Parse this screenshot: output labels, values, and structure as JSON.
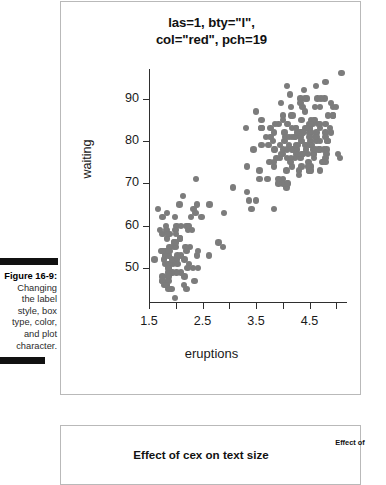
{
  "caption": {
    "figure_label": "Figure 16-9:",
    "text": "Changing the label style, box type, color, and plot character.",
    "lines": [
      "Figure 16-9:",
      "Changing",
      "the label",
      "style, box",
      "type, color,",
      "and plot",
      "character."
    ]
  },
  "main_figure": {
    "title_line1": "las=1, bty=\"l\",",
    "title_line2": "col=\"red\", pch=19"
  },
  "next_figure": {
    "title": "Effect of cex on text size",
    "side_title": "Effect of"
  },
  "colors": {
    "point_gray": "#7c7c7c",
    "axis": "#2f2f2f",
    "panel_border": "#b9b9b9",
    "rule_black": "#111111",
    "text": "#1a1a1a"
  },
  "chart_data": {
    "type": "scatter",
    "title": "las=1, bty=\"l\", col=\"red\", pch=19",
    "xlabel": "eruptions",
    "ylabel": "waiting",
    "xlim": [
      1.5,
      5.2
    ],
    "ylim": [
      42,
      97
    ],
    "grid": false,
    "legend": null,
    "point_color": "#7c7c7c",
    "point_symbol": "filled-circle",
    "x_ticks": [
      1.5,
      2.0,
      2.5,
      3.0,
      3.5,
      4.0,
      4.5,
      5.0
    ],
    "x_tick_labels": [
      "1.5",
      "",
      "2.5",
      "",
      "3.5",
      "",
      "4.5",
      ""
    ],
    "y_ticks": [
      50,
      60,
      70,
      80,
      90
    ],
    "y_tick_labels": [
      "50",
      "60",
      "70",
      "80",
      "90"
    ],
    "series": [
      {
        "name": "faithful",
        "x": [
          3.6,
          1.8,
          3.333,
          2.283,
          4.533,
          2.883,
          4.7,
          3.6,
          1.95,
          4.35,
          1.833,
          3.917,
          4.2,
          1.75,
          4.7,
          2.167,
          1.75,
          4.8,
          1.6,
          4.25,
          1.8,
          1.75,
          3.45,
          3.067,
          4.533,
          3.6,
          1.967,
          4.083,
          3.85,
          4.433,
          4.3,
          4.467,
          3.367,
          4.033,
          3.833,
          2.017,
          1.867,
          4.833,
          1.833,
          4.783,
          4.35,
          1.883,
          4.567,
          1.75,
          4.533,
          3.317,
          3.833,
          2.1,
          4.633,
          2.0,
          4.8,
          4.716,
          1.833,
          4.833,
          1.733,
          4.883,
          3.717,
          1.667,
          4.567,
          4.317,
          2.233,
          4.5,
          1.75,
          4.8,
          1.817,
          4.4,
          4.167,
          4.7,
          2.067,
          4.7,
          4.033,
          1.967,
          4.5,
          4.0,
          1.983,
          5.067,
          2.017,
          4.567,
          3.883,
          3.6,
          4.133,
          4.333,
          4.1,
          2.633,
          4.067,
          4.933,
          3.95,
          4.517,
          2.167,
          4.0,
          2.2,
          4.333,
          1.867,
          4.817,
          1.833,
          4.3,
          4.667,
          3.75,
          1.867,
          4.9,
          2.483,
          4.367,
          2.1,
          4.5,
          4.05,
          1.867,
          4.7,
          1.783,
          4.85,
          3.683,
          4.733,
          2.3,
          4.9,
          4.417,
          1.7,
          4.633,
          2.317,
          4.6,
          1.817,
          4.417,
          2.617,
          4.067,
          4.25,
          1.967,
          4.6,
          3.767,
          1.917,
          4.5,
          2.267,
          4.65,
          1.867,
          4.167,
          2.8,
          4.333,
          1.833,
          4.383,
          1.883,
          4.933,
          2.033,
          3.733,
          4.233,
          2.233,
          4.533,
          4.817,
          4.333,
          1.983,
          4.633,
          2.017,
          5.1,
          1.8,
          5.033,
          4.0,
          2.4,
          4.6,
          3.567,
          4.0,
          4.5,
          4.083,
          1.8,
          3.967,
          2.2,
          4.15,
          2.0,
          3.833,
          3.5,
          4.583,
          2.367,
          5.0,
          1.933,
          4.617,
          1.917,
          2.083,
          4.583,
          3.333,
          4.167,
          4.333,
          4.5,
          2.417,
          4.0,
          4.167,
          1.883,
          4.583,
          4.25,
          3.767,
          2.033,
          4.433,
          4.083,
          1.833,
          4.417,
          2.183,
          4.8,
          1.833,
          4.8,
          4.1,
          3.966,
          4.233,
          3.5,
          4.366,
          2.25,
          4.667,
          2.1,
          4.35,
          4.133,
          1.867,
          4.6,
          1.783,
          4.367,
          3.85,
          1.933,
          4.5,
          2.383,
          4.7,
          1.867,
          3.833,
          3.417,
          4.233,
          2.4,
          4.8,
          2.0,
          4.15,
          1.867,
          4.267,
          1.75,
          4.483,
          4.0,
          4.117,
          4.083,
          4.267,
          3.917,
          4.55,
          4.083,
          2.417,
          4.183,
          2.217,
          4.45,
          1.883,
          1.85,
          4.283,
          3.95,
          2.333,
          4.15,
          2.35,
          4.933,
          2.9,
          4.583,
          3.833,
          2.083,
          4.367,
          2.133,
          4.35,
          2.2,
          4.45,
          3.567,
          4.5,
          4.15,
          3.817,
          3.917,
          4.45,
          2.0,
          4.283,
          4.767,
          4.533,
          1.85,
          4.25,
          1.983,
          2.25,
          4.75,
          4.117,
          2.15,
          4.417,
          1.817,
          4.467
        ],
        "y": [
          79,
          54,
          74,
          62,
          85,
          55,
          88,
          85,
          51,
          85,
          54,
          84,
          78,
          47,
          83,
          52,
          62,
          84,
          52,
          79,
          51,
          47,
          78,
          69,
          74,
          83,
          55,
          76,
          78,
          79,
          73,
          77,
          66,
          80,
          74,
          52,
          48,
          80,
          59,
          90,
          80,
          58,
          84,
          58,
          73,
          83,
          64,
          53,
          82,
          59,
          75,
          90,
          54,
          80,
          54,
          83,
          71,
          64,
          77,
          81,
          59,
          84,
          48,
          82,
          60,
          92,
          78,
          78,
          65,
          73,
          82,
          56,
          79,
          71,
          62,
          76,
          60,
          78,
          76,
          83,
          75,
          82,
          70,
          65,
          73,
          88,
          76,
          80,
          48,
          86,
          60,
          90,
          50,
          78,
          63,
          72,
          84,
          75,
          51,
          82,
          62,
          88,
          49,
          83,
          81,
          47,
          84,
          52,
          86,
          81,
          75,
          59,
          89,
          79,
          59,
          81,
          50,
          85,
          59,
          87,
          53,
          69,
          77,
          56,
          88,
          81,
          45,
          82,
          55,
          90,
          45,
          83,
          56,
          89,
          46,
          82,
          51,
          86,
          53,
          79,
          81,
          60,
          82,
          77,
          76,
          59,
          80,
          49,
          96,
          53,
          77,
          77,
          65,
          81,
          71,
          70,
          81,
          93,
          53,
          89,
          45,
          86,
          58,
          78,
          66,
          76,
          63,
          88,
          52,
          93,
          49,
          57,
          77,
          68,
          81,
          81,
          73,
          50,
          85,
          74,
          55,
          77,
          83,
          83,
          51,
          78,
          84,
          46,
          83,
          55,
          81,
          57,
          76,
          84,
          77,
          81,
          87,
          77,
          51,
          78,
          60,
          82,
          91,
          53,
          78,
          46,
          77,
          84,
          49,
          83,
          71,
          80,
          49,
          75,
          64,
          76,
          53,
          94,
          55,
          76,
          50,
          82,
          54,
          75,
          78,
          79,
          78,
          78,
          70,
          79,
          70,
          54,
          86,
          50,
          90,
          54,
          54,
          77,
          79,
          64,
          75,
          47,
          86,
          63,
          85,
          82,
          57,
          82,
          67,
          74,
          54,
          83,
          73,
          73,
          88,
          80,
          71,
          83,
          56,
          79,
          78,
          84,
          58,
          83,
          43,
          60,
          75,
          81,
          46,
          90,
          46,
          74
        ]
      }
    ]
  }
}
